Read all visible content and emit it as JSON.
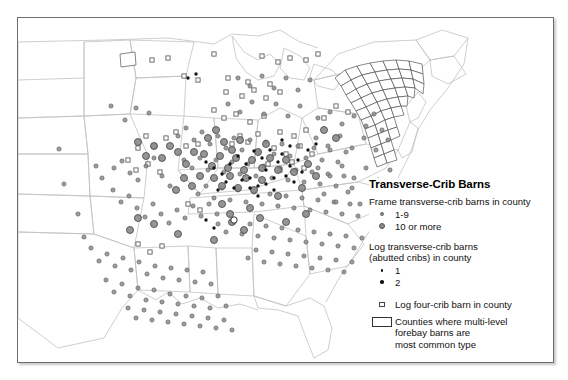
{
  "figure": {
    "kind": "thematic-dot-map",
    "region": "Eastern and central United States",
    "frame_border_color": "#6e6e6e"
  },
  "legend": {
    "title": "Transverse-Crib Barns",
    "groups": [
      {
        "heading": "Frame transverse-crib barns in county",
        "items": [
          {
            "symbol": "small-gray-circle",
            "label": "1-9"
          },
          {
            "symbol": "large-gray-circle",
            "label": "10 or more"
          }
        ]
      },
      {
        "heading_line1": "Log transverse-crib barns",
        "heading_line2": "(abutted cribs) in county",
        "items": [
          {
            "symbol": "small-black-dot",
            "label": "1"
          },
          {
            "symbol": "medium-black-dot",
            "label": "2"
          }
        ]
      },
      {
        "items": [
          {
            "symbol": "open-square",
            "label": "Log four-crib barn in county"
          }
        ]
      },
      {
        "items": [
          {
            "symbol": "open-rectangle",
            "label_line1": "Counties where multi-level",
            "label_line2": "forebay barns are",
            "label_line3": "most common type"
          }
        ]
      }
    ]
  },
  "colors": {
    "gray_symbol_fill": "#8a8a8a",
    "gray_symbol_stroke": "#555555",
    "black_symbol": "#111111",
    "state_outline": "#b9b9b9",
    "county_outline": "#777777",
    "background": "#ffffff"
  },
  "map_data": {
    "type": "scatter",
    "description": "Point symbols placed on an outline map of the eastern/central United States showing county counts of transverse-crib barns.",
    "state_outlines": [
      "M 10 36 L 92 32 L 96 86 L 14 90 Z",
      "M 92 32 L 168 30 L 170 76 L 96 86 Z"
    ],
    "frame_gray_circles_small": [
      [
        41,
        131
      ],
      [
        46,
        166
      ],
      [
        93,
        88
      ],
      [
        107,
        102
      ],
      [
        118,
        90
      ],
      [
        131,
        95
      ],
      [
        60,
        196
      ],
      [
        66,
        219
      ],
      [
        78,
        148
      ],
      [
        84,
        160
      ],
      [
        96,
        150
      ],
      [
        104,
        143
      ],
      [
        112,
        155
      ],
      [
        120,
        162
      ],
      [
        128,
        148
      ],
      [
        136,
        140
      ],
      [
        144,
        158
      ],
      [
        152,
        168
      ],
      [
        95,
        172
      ],
      [
        103,
        184
      ],
      [
        111,
        178
      ],
      [
        119,
        190
      ],
      [
        127,
        199
      ],
      [
        135,
        186
      ],
      [
        143,
        196
      ],
      [
        151,
        205
      ],
      [
        159,
        192
      ],
      [
        167,
        200
      ],
      [
        175,
        188
      ],
      [
        183,
        198
      ],
      [
        191,
        186
      ],
      [
        199,
        196
      ],
      [
        73,
        230
      ],
      [
        81,
        243
      ],
      [
        89,
        236
      ],
      [
        97,
        248
      ],
      [
        105,
        240
      ],
      [
        113,
        252
      ],
      [
        121,
        244
      ],
      [
        129,
        256
      ],
      [
        137,
        248
      ],
      [
        145,
        260
      ],
      [
        153,
        250
      ],
      [
        161,
        262
      ],
      [
        169,
        252
      ],
      [
        177,
        264
      ],
      [
        185,
        254
      ],
      [
        193,
        266
      ],
      [
        88,
        262
      ],
      [
        96,
        274
      ],
      [
        104,
        266
      ],
      [
        112,
        278
      ],
      [
        120,
        270
      ],
      [
        128,
        282
      ],
      [
        136,
        272
      ],
      [
        144,
        284
      ],
      [
        152,
        276
      ],
      [
        160,
        286
      ],
      [
        168,
        278
      ],
      [
        176,
        288
      ],
      [
        184,
        280
      ],
      [
        192,
        290
      ],
      [
        200,
        278
      ],
      [
        208,
        288
      ],
      [
        110,
        290
      ],
      [
        118,
        300
      ],
      [
        126,
        292
      ],
      [
        134,
        302
      ],
      [
        142,
        294
      ],
      [
        150,
        304
      ],
      [
        158,
        296
      ],
      [
        166,
        306
      ],
      [
        174,
        298
      ],
      [
        182,
        308
      ],
      [
        190,
        300
      ],
      [
        198,
        310
      ],
      [
        206,
        302
      ],
      [
        214,
        312
      ],
      [
        160,
        118
      ],
      [
        168,
        110
      ],
      [
        176,
        122
      ],
      [
        184,
        114
      ],
      [
        192,
        126
      ],
      [
        200,
        118
      ],
      [
        208,
        130
      ],
      [
        216,
        120
      ],
      [
        224,
        132
      ],
      [
        232,
        122
      ],
      [
        240,
        134
      ],
      [
        248,
        124
      ],
      [
        256,
        136
      ],
      [
        264,
        126
      ],
      [
        272,
        138
      ],
      [
        280,
        128
      ],
      [
        288,
        140
      ],
      [
        296,
        130
      ],
      [
        304,
        142
      ],
      [
        312,
        132
      ],
      [
        320,
        144
      ],
      [
        328,
        134
      ],
      [
        166,
        142
      ],
      [
        174,
        150
      ],
      [
        182,
        140
      ],
      [
        190,
        152
      ],
      [
        198,
        142
      ],
      [
        206,
        154
      ],
      [
        214,
        144
      ],
      [
        222,
        156
      ],
      [
        230,
        146
      ],
      [
        238,
        158
      ],
      [
        246,
        148
      ],
      [
        254,
        160
      ],
      [
        262,
        150
      ],
      [
        270,
        162
      ],
      [
        278,
        152
      ],
      [
        286,
        164
      ],
      [
        294,
        154
      ],
      [
        302,
        166
      ],
      [
        310,
        156
      ],
      [
        318,
        168
      ],
      [
        326,
        158
      ],
      [
        334,
        170
      ],
      [
        180,
        176
      ],
      [
        188,
        168
      ],
      [
        196,
        180
      ],
      [
        204,
        170
      ],
      [
        212,
        182
      ],
      [
        220,
        172
      ],
      [
        228,
        184
      ],
      [
        236,
        174
      ],
      [
        244,
        186
      ],
      [
        252,
        176
      ],
      [
        260,
        188
      ],
      [
        268,
        178
      ],
      [
        276,
        190
      ],
      [
        284,
        180
      ],
      [
        292,
        192
      ],
      [
        300,
        182
      ],
      [
        308,
        194
      ],
      [
        316,
        184
      ],
      [
        324,
        196
      ],
      [
        332,
        186
      ],
      [
        340,
        198
      ],
      [
        200,
        206
      ],
      [
        208,
        214
      ],
      [
        216,
        204
      ],
      [
        224,
        216
      ],
      [
        232,
        206
      ],
      [
        240,
        218
      ],
      [
        248,
        208
      ],
      [
        256,
        220
      ],
      [
        264,
        210
      ],
      [
        272,
        222
      ],
      [
        280,
        212
      ],
      [
        288,
        224
      ],
      [
        296,
        214
      ],
      [
        304,
        226
      ],
      [
        312,
        216
      ],
      [
        320,
        228
      ],
      [
        328,
        218
      ],
      [
        336,
        230
      ],
      [
        344,
        220
      ],
      [
        230,
        240
      ],
      [
        238,
        232
      ],
      [
        246,
        244
      ],
      [
        254,
        234
      ],
      [
        262,
        246
      ],
      [
        270,
        236
      ],
      [
        278,
        248
      ],
      [
        286,
        238
      ],
      [
        294,
        250
      ],
      [
        302,
        240
      ],
      [
        310,
        252
      ],
      [
        318,
        242
      ],
      [
        326,
        254
      ],
      [
        334,
        244
      ],
      [
        300,
        100
      ],
      [
        312,
        94
      ],
      [
        324,
        106
      ],
      [
        336,
        98
      ],
      [
        348,
        108
      ],
      [
        356,
        96
      ],
      [
        364,
        112
      ],
      [
        298,
        120
      ],
      [
        310,
        128
      ],
      [
        322,
        118
      ],
      [
        334,
        130
      ],
      [
        346,
        120
      ],
      [
        358,
        132
      ],
      [
        370,
        122
      ],
      [
        300,
        150
      ],
      [
        312,
        158
      ],
      [
        324,
        148
      ],
      [
        336,
        160
      ],
      [
        348,
        150
      ],
      [
        360,
        162
      ],
      [
        372,
        152
      ],
      [
        306,
        176
      ],
      [
        318,
        184
      ],
      [
        330,
        174
      ],
      [
        342,
        186
      ],
      [
        354,
        176
      ],
      [
        366,
        188
      ],
      [
        220,
        60
      ],
      [
        232,
        68
      ],
      [
        244,
        58
      ],
      [
        256,
        70
      ],
      [
        268,
        60
      ],
      [
        280,
        72
      ],
      [
        292,
        62
      ],
      [
        210,
        86
      ],
      [
        222,
        94
      ],
      [
        234,
        84
      ],
      [
        246,
        96
      ],
      [
        258,
        86
      ],
      [
        270,
        98
      ],
      [
        282,
        88
      ]
    ],
    "frame_gray_circles_large": [
      [
        186,
        136
      ],
      [
        194,
        148
      ],
      [
        202,
        138
      ],
      [
        210,
        150
      ],
      [
        218,
        140
      ],
      [
        226,
        152
      ],
      [
        234,
        142
      ],
      [
        196,
        160
      ],
      [
        204,
        168
      ],
      [
        212,
        158
      ],
      [
        220,
        170
      ],
      [
        228,
        160
      ],
      [
        236,
        172
      ],
      [
        244,
        162
      ],
      [
        206,
        124
      ],
      [
        214,
        132
      ],
      [
        222,
        122
      ],
      [
        240,
        134
      ],
      [
        248,
        126
      ],
      [
        190,
        120
      ],
      [
        198,
        112
      ],
      [
        176,
        134
      ],
      [
        168,
        146
      ],
      [
        160,
        134
      ],
      [
        182,
        158
      ],
      [
        174,
        168
      ],
      [
        166,
        160
      ],
      [
        158,
        172
      ],
      [
        244,
        150
      ],
      [
        252,
        140
      ],
      [
        260,
        152
      ],
      [
        268,
        142
      ],
      [
        276,
        154
      ],
      [
        212,
        196
      ],
      [
        204,
        186
      ],
      [
        232,
        190
      ],
      [
        260,
        178
      ],
      [
        284,
        170
      ],
      [
        306,
        112
      ],
      [
        318,
        120
      ],
      [
        290,
        146
      ],
      [
        298,
        158
      ],
      [
        152,
        128
      ],
      [
        144,
        140
      ],
      [
        136,
        128
      ],
      [
        128,
        138
      ],
      [
        120,
        124
      ],
      [
        120,
        200
      ],
      [
        112,
        212
      ],
      [
        136,
        206
      ],
      [
        160,
        216
      ],
      [
        214,
        204
      ],
      [
        226,
        212
      ],
      [
        196,
        222
      ],
      [
        242,
        200
      ],
      [
        268,
        204
      ],
      [
        288,
        196
      ]
    ],
    "black_dots": [
      [
        236,
        133
      ],
      [
        244,
        140
      ],
      [
        252,
        132
      ],
      [
        260,
        144
      ],
      [
        248,
        152
      ],
      [
        256,
        160
      ],
      [
        264,
        136
      ],
      [
        228,
        146
      ],
      [
        220,
        138
      ],
      [
        212,
        146
      ],
      [
        204,
        156
      ],
      [
        196,
        150
      ],
      [
        188,
        144
      ],
      [
        272,
        148
      ],
      [
        280,
        142
      ],
      [
        268,
        158
      ],
      [
        276,
        164
      ],
      [
        284,
        154
      ],
      [
        232,
        160
      ],
      [
        240,
        168
      ],
      [
        248,
        166
      ],
      [
        256,
        172
      ],
      [
        240,
        178
      ],
      [
        232,
        170
      ],
      [
        224,
        162
      ],
      [
        216,
        170
      ],
      [
        208,
        164
      ],
      [
        200,
        172
      ],
      [
        196,
        210
      ],
      [
        188,
        202
      ],
      [
        264,
        122
      ],
      [
        272,
        128
      ],
      [
        170,
        60
      ],
      [
        178,
        56
      ],
      [
        290,
        132
      ],
      [
        298,
        126
      ]
    ],
    "open_squares": [
      [
        134,
        42
      ],
      [
        150,
        40
      ],
      [
        196,
        36
      ],
      [
        244,
        38
      ],
      [
        260,
        44
      ],
      [
        272,
        40
      ],
      [
        288,
        42
      ],
      [
        300,
        36
      ],
      [
        166,
        58
      ],
      [
        180,
        62
      ],
      [
        210,
        60
      ],
      [
        230,
        64
      ],
      [
        252,
        66
      ],
      [
        208,
        74
      ],
      [
        224,
        78
      ],
      [
        236,
        72
      ],
      [
        248,
        80
      ],
      [
        262,
        74
      ],
      [
        196,
        92
      ],
      [
        206,
        100
      ],
      [
        218,
        96
      ],
      [
        232,
        104
      ],
      [
        246,
        98
      ],
      [
        128,
        118
      ],
      [
        136,
        128
      ],
      [
        120,
        130
      ],
      [
        148,
        120
      ],
      [
        158,
        114
      ],
      [
        110,
        142
      ],
      [
        118,
        152
      ],
      [
        130,
        146
      ],
      [
        142,
        154
      ],
      [
        168,
        128
      ],
      [
        180,
        126
      ],
      [
        262,
        114
      ],
      [
        276,
        118
      ],
      [
        288,
        112
      ],
      [
        256,
        130
      ],
      [
        268,
        136
      ],
      [
        282,
        128
      ],
      [
        294,
        136
      ],
      [
        250,
        146
      ],
      [
        262,
        152
      ],
      [
        274,
        144
      ],
      [
        286,
        150
      ],
      [
        170,
        186
      ],
      [
        182,
        192
      ],
      [
        120,
        226
      ],
      [
        132,
        234
      ],
      [
        144,
        228
      ],
      [
        214,
        126
      ],
      [
        222,
        118
      ],
      [
        230,
        124
      ],
      [
        240,
        116
      ],
      [
        318,
        88
      ],
      [
        330,
        94
      ],
      [
        306,
        100
      ]
    ],
    "open_circle_markers": [
      [
        216,
        202
      ]
    ],
    "forebay_counties_cluster": {
      "centroid": [
        368,
        60
      ],
      "bounds": [
        325,
        28,
        100,
        80
      ],
      "note": "Pennsylvania / Maryland / northern Virginia counties outlined as polygons where multi-level forebay barns are the most common type"
    }
  }
}
